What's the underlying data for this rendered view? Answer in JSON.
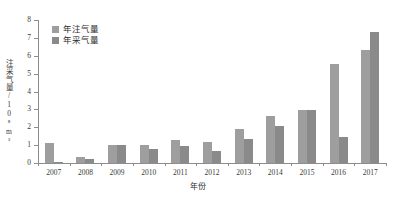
{
  "chart_data": {
    "type": "bar",
    "title": "",
    "xlabel": "年份",
    "ylabel": "注采气量/10⁸m³",
    "categories": [
      "2007",
      "2008",
      "2009",
      "2010",
      "2011",
      "2012",
      "2013",
      "2014",
      "2015",
      "2016",
      "2017"
    ],
    "series": [
      {
        "name": "年注气量",
        "color": "#9e9e9e",
        "values": [
          1.1,
          0.35,
          0.98,
          0.98,
          1.28,
          1.18,
          1.88,
          2.65,
          2.98,
          5.55,
          6.32
        ]
      },
      {
        "name": "年采气量",
        "color": "#8a8a8a",
        "values": [
          0.08,
          0.25,
          0.98,
          0.78,
          0.95,
          0.65,
          1.33,
          2.08,
          2.98,
          1.45,
          7.33
        ]
      }
    ],
    "ylim": [
      0,
      8
    ],
    "ytick_labels": [
      "0",
      "1",
      "2",
      "3",
      "4",
      "5",
      "6",
      "7",
      "8"
    ],
    "ytick_values": [
      0,
      1,
      2,
      3,
      4,
      5,
      6,
      7,
      8
    ],
    "grid": false,
    "legend_position": "top-left"
  }
}
